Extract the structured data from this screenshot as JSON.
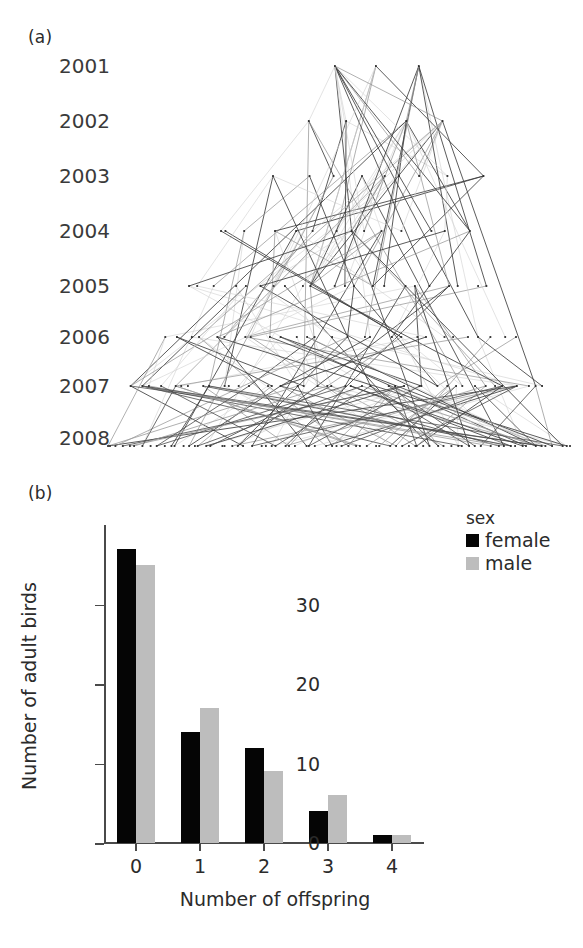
{
  "figure": {
    "panel_a": {
      "label": "(a)",
      "year_labels": [
        "2001",
        "2002",
        "2003",
        "2004",
        "2005",
        "2006",
        "2007",
        "2008"
      ],
      "description": "pedigree-kinship-network"
    },
    "panel_b": {
      "label": "(b)",
      "legend": {
        "title": "sex",
        "entries": [
          {
            "label": "female",
            "color": "#050505"
          },
          {
            "label": "male",
            "color": "#bdbdbd"
          }
        ]
      }
    }
  },
  "chart_data": [
    {
      "type": "line",
      "title": "(a)",
      "xlabel": "",
      "ylabel": "",
      "ytick_labels": [
        "2001",
        "2002",
        "2003",
        "2004",
        "2005",
        "2006",
        "2007",
        "2008"
      ],
      "yticks": [
        2001,
        2002,
        2003,
        2004,
        2005,
        2006,
        2007,
        2008
      ],
      "ylim": [
        2008,
        2001
      ],
      "grid": false,
      "legend_position": "none",
      "annotations": [
        "pedigree network: nodes are individual birds positioned by birth year row; line segments are parent-offspring links"
      ],
      "nodes_per_year": [
        3,
        4,
        9,
        14,
        22,
        28,
        42,
        74
      ],
      "edge_count": 186
    },
    {
      "type": "bar",
      "title": "(b)",
      "categories": [
        "0",
        "1",
        "2",
        "3",
        "4"
      ],
      "series": [
        {
          "name": "female",
          "color": "#050505",
          "values": [
            37,
            14,
            12,
            4,
            1
          ]
        },
        {
          "name": "male",
          "color": "#bdbdbd",
          "values": [
            35,
            17,
            9,
            6,
            1
          ]
        }
      ],
      "xlabel": "Number of offspring",
      "ylabel": "Number of adult birds",
      "ylim": [
        0,
        40
      ],
      "yticks": [
        0,
        10,
        20,
        30
      ],
      "ytick_labels": [
        "0",
        "10",
        "20",
        "30"
      ],
      "grid": false,
      "legend_title": "sex",
      "legend_position": "top-right"
    }
  ]
}
